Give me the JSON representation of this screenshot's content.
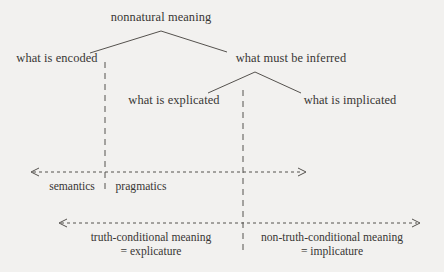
{
  "diagram": {
    "title": "nonnatural meaning",
    "background_color": "#f2f1ef",
    "ink_color": "#3a3a3a",
    "tree": {
      "root": {
        "label": "nonnatural meaning",
        "x": 161,
        "y": 17
      },
      "level1": [
        {
          "label": "what is encoded",
          "x": 57,
          "y": 58
        },
        {
          "label": "what must be inferred",
          "x": 291,
          "y": 58
        }
      ],
      "level2": [
        {
          "label": "what is explicated",
          "x": 174,
          "y": 100
        },
        {
          "label": "what is implicated",
          "x": 350,
          "y": 100
        }
      ]
    },
    "dividers": [
      {
        "name": "semantics-pragmatics-divider",
        "x": 105,
        "y1": 62,
        "y2": 190
      },
      {
        "name": "explicature-implicature-divider",
        "x": 243,
        "y1": 90,
        "y2": 252
      }
    ],
    "scales": [
      {
        "name": "semantics-pragmatics-scale",
        "arrow_y": 172,
        "x1": 30,
        "x2": 306,
        "labels": [
          {
            "text": "semantics",
            "x": 72,
            "y": 180
          },
          {
            "text": "pragmatics",
            "x": 140,
            "y": 180
          }
        ]
      },
      {
        "name": "truth-conditional-scale",
        "arrow_y": 223,
        "x1": 58,
        "x2": 420,
        "labels": [
          {
            "text": "truth-conditional meaning",
            "subtext": "= explicature",
            "x": 151,
            "y": 231
          },
          {
            "text": "non-truth-conditional meaning",
            "subtext": "= implicature",
            "x": 332,
            "y": 231
          }
        ]
      }
    ]
  }
}
